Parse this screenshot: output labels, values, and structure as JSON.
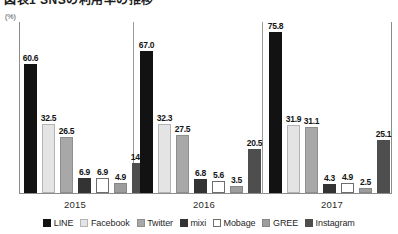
{
  "header": {
    "title": "図表1 SNSの利用率の推移",
    "unit_label": "(%)"
  },
  "legend": {
    "position": "bottom-center",
    "items": [
      {
        "label": "LINE",
        "swatch": "s-line",
        "color": "#121212"
      },
      {
        "label": "Facebook",
        "swatch": "s-facebook",
        "color": "#e4e4e4"
      },
      {
        "label": "Twitter",
        "swatch": "s-twitter",
        "color": "#a8a8a8"
      },
      {
        "label": "mixi",
        "swatch": "s-mixi",
        "color": "#333333"
      },
      {
        "label": "Mobage",
        "swatch": "s-mobage",
        "color": "#ffffff"
      },
      {
        "label": "GREE",
        "swatch": "s-gree",
        "color": "#9d9d9d"
      },
      {
        "label": "Instagram",
        "swatch": "s-instagram",
        "color": "#4e4e4e"
      }
    ]
  },
  "axis": {
    "year_labels": [
      "2015",
      "2016",
      "2017"
    ]
  },
  "chart_data": {
    "type": "bar",
    "title": "図表1 SNSの利用率の推移",
    "xlabel": "",
    "ylabel": "(%)",
    "ylim": [
      0,
      80
    ],
    "grid": false,
    "legend_position": "bottom-center",
    "categories": [
      "2015",
      "2016",
      "2017"
    ],
    "series": [
      {
        "name": "LINE",
        "values": [
          60.6,
          67.0,
          75.8
        ]
      },
      {
        "name": "Facebook",
        "values": [
          32.5,
          32.3,
          31.9
        ]
      },
      {
        "name": "Twitter",
        "values": [
          26.5,
          27.5,
          31.1
        ]
      },
      {
        "name": "mixi",
        "values": [
          6.9,
          6.8,
          4.3
        ]
      },
      {
        "name": "Mobage",
        "values": [
          6.9,
          5.6,
          4.9
        ]
      },
      {
        "name": "GREE",
        "values": [
          4.9,
          3.5,
          2.5
        ]
      },
      {
        "name": "Instagram",
        "values": [
          14.3,
          20.5,
          25.1
        ]
      }
    ],
    "value_labels": {
      "2015": [
        "60.6",
        "32.5",
        "26.5",
        "6.9",
        "6.9",
        "4.9",
        "14.3"
      ],
      "2016": [
        "67.0",
        "32.3",
        "27.5",
        "6.8",
        "5.6",
        "3.5",
        "20.5"
      ],
      "2017": [
        "75.8",
        "31.9",
        "31.1",
        "4.3",
        "4.9",
        "2.5",
        "25.1"
      ]
    }
  }
}
